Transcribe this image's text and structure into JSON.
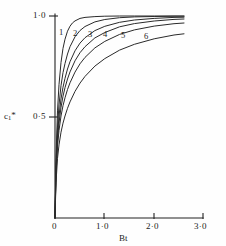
{
  "figure": {
    "background_color": "#fefefe",
    "ink_color": "#222222"
  },
  "axes": {
    "y": {
      "title": "c",
      "title_sub": "1",
      "title_star": "*",
      "ticks": [
        {
          "value": 0.5,
          "label": "0·5"
        },
        {
          "value": 1.0,
          "label": "1·0"
        }
      ]
    },
    "x": {
      "title": "Bt",
      "ticks": [
        {
          "value": 0.0,
          "label": "0"
        },
        {
          "value": 1.0,
          "label": "1·0"
        },
        {
          "value": 2.0,
          "label": "2·0"
        },
        {
          "value": 3.0,
          "label": "3·0"
        }
      ]
    }
  },
  "curve_labels": [
    {
      "name": "1",
      "x": 59,
      "y": 28
    },
    {
      "name": "2",
      "x": 73,
      "y": 29
    },
    {
      "name": "3",
      "x": 88,
      "y": 30
    },
    {
      "name": "4",
      "x": 103,
      "y": 30
    },
    {
      "name": "5",
      "x": 121,
      "y": 31
    },
    {
      "name": "6",
      "x": 144,
      "y": 32
    }
  ],
  "chart_data": {
    "type": "line",
    "title": "",
    "xlabel": "Bt",
    "ylabel": "c1*",
    "xlim": [
      0.0,
      3.0
    ],
    "ylim": [
      0.0,
      1.05
    ],
    "grid": false,
    "legend": "inline-curve-numbers",
    "xticks": [
      0.0,
      1.0,
      2.0,
      3.0
    ],
    "yticks": [
      0.5,
      1.0
    ],
    "series": [
      {
        "name": "1",
        "x": [
          0.0,
          0.02,
          0.05,
          0.08,
          0.12,
          0.16,
          0.2,
          0.25,
          0.3,
          0.35,
          0.4,
          0.5,
          0.6,
          0.8,
          1.0,
          1.3,
          1.6,
          2.0,
          2.4
        ],
        "values": [
          0.0,
          0.3,
          0.53,
          0.66,
          0.77,
          0.84,
          0.885,
          0.925,
          0.95,
          0.966,
          0.976,
          0.988,
          0.993,
          0.997,
          0.999,
          1.0,
          1.0,
          1.0,
          1.0
        ]
      },
      {
        "name": "2",
        "x": [
          0.0,
          0.02,
          0.05,
          0.08,
          0.12,
          0.16,
          0.2,
          0.25,
          0.3,
          0.4,
          0.5,
          0.6,
          0.8,
          1.0,
          1.3,
          1.6,
          2.0,
          2.4
        ],
        "values": [
          0.0,
          0.26,
          0.45,
          0.56,
          0.655,
          0.72,
          0.765,
          0.812,
          0.848,
          0.897,
          0.928,
          0.948,
          0.971,
          0.983,
          0.992,
          0.996,
          0.998,
          0.999
        ]
      },
      {
        "name": "3",
        "x": [
          0.0,
          0.02,
          0.05,
          0.08,
          0.12,
          0.16,
          0.2,
          0.25,
          0.3,
          0.4,
          0.5,
          0.6,
          0.8,
          1.0,
          1.3,
          1.6,
          2.0,
          2.4
        ],
        "values": [
          0.0,
          0.24,
          0.41,
          0.505,
          0.59,
          0.648,
          0.692,
          0.738,
          0.774,
          0.828,
          0.866,
          0.893,
          0.928,
          0.949,
          0.969,
          0.98,
          0.988,
          0.993
        ]
      },
      {
        "name": "4",
        "x": [
          0.0,
          0.02,
          0.05,
          0.08,
          0.12,
          0.16,
          0.2,
          0.25,
          0.3,
          0.4,
          0.5,
          0.6,
          0.8,
          1.0,
          1.3,
          1.6,
          2.0,
          2.4
        ],
        "values": [
          0.0,
          0.225,
          0.385,
          0.47,
          0.548,
          0.603,
          0.645,
          0.688,
          0.723,
          0.778,
          0.818,
          0.848,
          0.891,
          0.918,
          0.946,
          0.962,
          0.975,
          0.983
        ]
      },
      {
        "name": "5",
        "x": [
          0.0,
          0.02,
          0.05,
          0.08,
          0.12,
          0.16,
          0.2,
          0.25,
          0.3,
          0.4,
          0.5,
          0.6,
          0.8,
          1.0,
          1.3,
          1.6,
          2.0,
          2.4
        ],
        "values": [
          0.0,
          0.21,
          0.355,
          0.433,
          0.505,
          0.556,
          0.595,
          0.636,
          0.669,
          0.722,
          0.763,
          0.795,
          0.842,
          0.874,
          0.909,
          0.931,
          0.95,
          0.962
        ]
      },
      {
        "name": "6",
        "x": [
          0.0,
          0.02,
          0.05,
          0.08,
          0.12,
          0.16,
          0.2,
          0.25,
          0.3,
          0.4,
          0.5,
          0.6,
          0.8,
          1.0,
          1.3,
          1.6,
          2.0,
          2.4
        ],
        "values": [
          0.0,
          0.175,
          0.295,
          0.362,
          0.425,
          0.47,
          0.505,
          0.543,
          0.575,
          0.627,
          0.668,
          0.701,
          0.752,
          0.789,
          0.831,
          0.86,
          0.887,
          0.906
        ]
      }
    ]
  }
}
